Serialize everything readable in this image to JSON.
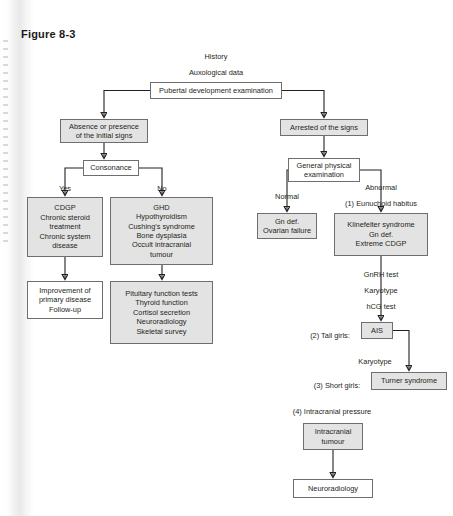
{
  "figure": {
    "label": "Figure 8-3"
  },
  "header_notes": [
    {
      "text": "History",
      "x": 216,
      "y": 52
    },
    {
      "text": "Auxological data",
      "x": 216,
      "y": 68
    }
  ],
  "nodes": [
    {
      "id": "pubertal",
      "name": "node-pubertal-development-examination",
      "style": "plain",
      "x": 150,
      "y": 82,
      "w": 132,
      "h": 17,
      "lines": [
        "Pubertal development examination"
      ]
    },
    {
      "id": "absence",
      "name": "node-absence-or-presence",
      "style": "shaded",
      "x": 60,
      "y": 119,
      "w": 88,
      "h": 24,
      "lines": [
        "Absence or presence",
        "of the initial signs"
      ]
    },
    {
      "id": "arrested",
      "name": "node-arrested-of-the-signs",
      "style": "shaded",
      "x": 280,
      "y": 119,
      "w": 88,
      "h": 17,
      "lines": [
        "Arrested of the signs"
      ]
    },
    {
      "id": "consonance",
      "name": "node-consonance",
      "style": "plain",
      "x": 83,
      "y": 160,
      "w": 56,
      "h": 16,
      "lines": [
        "Consonance"
      ]
    },
    {
      "id": "genphys",
      "name": "node-general-physical-examination",
      "style": "plain",
      "x": 288,
      "y": 158,
      "w": 72,
      "h": 24,
      "lines": [
        "General physical",
        "examination"
      ]
    },
    {
      "id": "cdgp",
      "name": "node-cdgp",
      "style": "shaded",
      "x": 27,
      "y": 197,
      "w": 76,
      "h": 60,
      "lines": [
        "CDGP",
        "Chronic steroid",
        "treatment",
        "Chronic system",
        "disease"
      ]
    },
    {
      "id": "ghd",
      "name": "node-ghd",
      "style": "shaded",
      "x": 110,
      "y": 197,
      "w": 103,
      "h": 68,
      "lines": [
        "GHD",
        "Hypothyroidism",
        "Cushing's syndrome",
        "Bone dysplasia",
        "Occult intracranial",
        "tumour"
      ]
    },
    {
      "id": "gndef",
      "name": "node-gn-def-ovarian-failure",
      "style": "shaded",
      "x": 257,
      "y": 213,
      "w": 60,
      "h": 26,
      "lines": [
        "Gn def.",
        "Ovarian failure"
      ]
    },
    {
      "id": "klinefelter",
      "name": "node-klinefelter-syndrome",
      "style": "shaded",
      "x": 334,
      "y": 213,
      "w": 94,
      "h": 43,
      "lines": [
        "Klinefelter syndrome",
        "Gn def.",
        "Extreme CDGP"
      ]
    },
    {
      "id": "improve",
      "name": "node-improvement-of-primary-disease",
      "style": "plain",
      "x": 27,
      "y": 281,
      "w": 76,
      "h": 38,
      "lines": [
        "Improvement of",
        "primary disease",
        "Follow-up"
      ]
    },
    {
      "id": "pituitary",
      "name": "node-pituitary-function-tests",
      "style": "shaded",
      "x": 110,
      "y": 281,
      "w": 103,
      "h": 63,
      "lines": [
        "Pituitary function tests",
        "Thyroid function",
        "Cortisol secretion",
        "Neuroradiology",
        "Skeletal survey"
      ]
    },
    {
      "id": "ais",
      "name": "node-ais",
      "style": "shaded",
      "x": 361,
      "y": 322,
      "w": 32,
      "h": 17,
      "lines": [
        "AIS"
      ]
    },
    {
      "id": "turner",
      "name": "node-turner-syndrome",
      "style": "shaded",
      "x": 371,
      "y": 372,
      "w": 76,
      "h": 18,
      "lines": [
        "Turner syndrome"
      ]
    },
    {
      "id": "intratum",
      "name": "node-intracranial-tumour",
      "style": "shaded",
      "x": 303,
      "y": 423,
      "w": 60,
      "h": 27,
      "lines": [
        "Intracranial",
        "tumour"
      ]
    },
    {
      "id": "neurorad",
      "name": "node-neuroradiology",
      "style": "plain",
      "x": 293,
      "y": 479,
      "w": 80,
      "h": 19,
      "lines": [
        "Neuroradiology"
      ]
    }
  ],
  "edge_labels": [
    {
      "id": "yes",
      "name": "edge-label-yes",
      "text": "Yes",
      "x": 65,
      "y": 184,
      "align": "center"
    },
    {
      "id": "no",
      "name": "edge-label-no",
      "text": "No",
      "x": 162,
      "y": 184,
      "align": "center"
    },
    {
      "id": "normal",
      "name": "edge-label-normal",
      "text": "Normal",
      "x": 287,
      "y": 192,
      "align": "center"
    },
    {
      "id": "abnormal",
      "name": "edge-label-abnormal",
      "text": "Abnormal",
      "x": 381,
      "y": 183,
      "align": "center"
    },
    {
      "id": "eunuchoid",
      "name": "edge-label-eunuchoid-habitus",
      "text": "(1) Eunuchoid habitus",
      "x": 381,
      "y": 199,
      "align": "center"
    },
    {
      "id": "gnrh",
      "name": "edge-label-gnrh-test",
      "text": "GnRH test",
      "x": 381,
      "y": 270,
      "align": "center"
    },
    {
      "id": "karyo1",
      "name": "edge-label-karyotype-1",
      "text": "Karyotype",
      "x": 381,
      "y": 286,
      "align": "center"
    },
    {
      "id": "hcg",
      "name": "edge-label-hcg-test",
      "text": "hCG test",
      "x": 381,
      "y": 302,
      "align": "center"
    },
    {
      "id": "tall",
      "name": "edge-label-tall-girls",
      "text": "(2) Tall girls:",
      "x": 330,
      "y": 331,
      "align": "center"
    },
    {
      "id": "karyo2",
      "name": "edge-label-karyotype-2",
      "text": "Karyotype",
      "x": 375,
      "y": 357,
      "align": "center"
    },
    {
      "id": "short",
      "name": "edge-label-short-girls",
      "text": "(3) Short girls:",
      "x": 337,
      "y": 381,
      "align": "center"
    },
    {
      "id": "intracp",
      "name": "edge-label-intracranial-pressure",
      "text": "(4) Intracranial pressure",
      "x": 332,
      "y": 407,
      "align": "center"
    }
  ],
  "connectors": {
    "color": "#231f20",
    "description": "solid orthogonal arrows between nodes; dashed-free"
  }
}
